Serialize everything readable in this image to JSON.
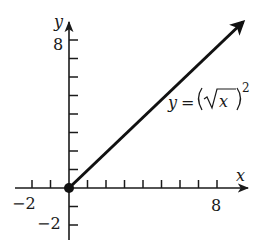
{
  "chart_data": {
    "type": "line",
    "title": "",
    "xlabel": "x",
    "ylabel": "y",
    "xlim": [
      -2.5,
      9.5
    ],
    "ylim": [
      -2.5,
      9
    ],
    "grid": false,
    "x_tick_labels": [
      "-2",
      "8"
    ],
    "y_tick_labels": [
      "8",
      "-2"
    ],
    "x_ticks": [
      -2,
      -1,
      1,
      2,
      3,
      4,
      5,
      6,
      7,
      8
    ],
    "y_ticks": [
      -2,
      -1,
      1,
      2,
      3,
      4,
      5,
      6,
      7,
      8
    ],
    "series": [
      {
        "name": "y = (√x)²",
        "x": [
          0,
          9.5
        ],
        "y": [
          0,
          9.0
        ],
        "start_point": {
          "x": 0,
          "y": 0,
          "marker": "filled-circle"
        },
        "end": "arrow"
      }
    ],
    "annotations": [
      {
        "text": "y = (√x)²",
        "x": 6.0,
        "y": 3.3
      }
    ]
  },
  "labels": {
    "x_axis": "x",
    "y_axis": "y",
    "x_neg2": "−2",
    "x_8": "8",
    "y_8": "8",
    "y_neg2": "−2",
    "eq_y": "y",
    "eq_equals": "=",
    "eq_x": "x",
    "eq_exp": "2"
  },
  "colors": {
    "axis": "#1a1a1a",
    "curve": "#111111",
    "background": "#ffffff"
  }
}
